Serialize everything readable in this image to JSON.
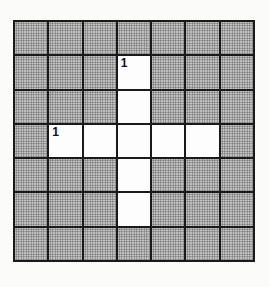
{
  "puzzle": {
    "rows": 7,
    "cols": 7,
    "cells": [
      [
        "shaded",
        "shaded",
        "shaded",
        "shaded",
        "shaded",
        "shaded",
        "shaded"
      ],
      [
        "shaded",
        "shaded",
        "shaded",
        "white",
        "shaded",
        "shaded",
        "shaded"
      ],
      [
        "shaded",
        "shaded",
        "shaded",
        "white",
        "shaded",
        "shaded",
        "shaded"
      ],
      [
        "shaded",
        "white",
        "white",
        "white",
        "white",
        "white",
        "shaded"
      ],
      [
        "shaded",
        "shaded",
        "shaded",
        "white",
        "shaded",
        "shaded",
        "shaded"
      ],
      [
        "shaded",
        "shaded",
        "shaded",
        "white",
        "shaded",
        "shaded",
        "shaded"
      ],
      [
        "shaded",
        "shaded",
        "shaded",
        "shaded",
        "shaded",
        "shaded",
        "shaded"
      ]
    ],
    "numbers": [
      {
        "row": 1,
        "col": 3,
        "label": "1"
      },
      {
        "row": 3,
        "col": 1,
        "label": "1"
      }
    ],
    "colors": {
      "shaded": "#c9c9c9",
      "white": "#fdfdfd",
      "grid_line": "#1a1a1a"
    }
  }
}
